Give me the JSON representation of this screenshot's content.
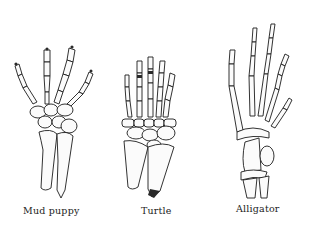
{
  "figures": [
    {
      "id": "mud-puppy",
      "label": "Mud puppy",
      "digits": 4
    },
    {
      "id": "turtle",
      "label": "Turtle",
      "digits": 5
    },
    {
      "id": "alligator",
      "label": "Alligator",
      "digits": 5
    }
  ],
  "colors": {
    "background": "#ffffff",
    "ink": "#1c1c1c"
  }
}
